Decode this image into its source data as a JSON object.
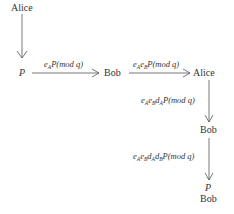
{
  "diagram": {
    "type": "protocol-flow",
    "nodes": {
      "alice_start": "Alice",
      "p_start": "P",
      "bob_1": "Bob",
      "alice_2": "Alice",
      "bob_2": "Bob",
      "p_end": "P",
      "bob_end": "Bob"
    },
    "edges": [
      {
        "from": "alice_start",
        "to": "p_start",
        "label": ""
      },
      {
        "from": "p_start",
        "to": "bob_1",
        "label": {
          "pre": "e",
          "subs": [
            "A"
          ],
          "post": "P(mod q)"
        }
      },
      {
        "from": "bob_1",
        "to": "alice_2",
        "label": {
          "parts": [
            [
              "e",
              "A"
            ],
            [
              "e",
              "B"
            ]
          ],
          "post": "P(mod q)"
        }
      },
      {
        "from": "alice_2",
        "to": "bob_2",
        "label": {
          "parts": [
            [
              "e",
              "A"
            ],
            [
              "e",
              "B"
            ],
            [
              "d",
              "A"
            ]
          ],
          "post": "P(mod q)"
        }
      },
      {
        "from": "bob_2",
        "to": "p_end",
        "label": {
          "parts": [
            [
              "e",
              "A"
            ],
            [
              "e",
              "B"
            ],
            [
              "d",
              "A"
            ],
            [
              "d",
              "B"
            ]
          ],
          "post": "P(mod q)"
        }
      }
    ],
    "mod_text": "P(mod q)",
    "stroke_color": "#555555"
  }
}
